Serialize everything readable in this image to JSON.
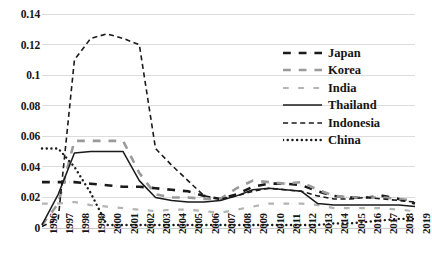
{
  "chart_data": {
    "type": "line",
    "title": "",
    "xlabel": "",
    "ylabel": "",
    "ylim": [
      0,
      0.14
    ],
    "ytick_step": 0.02,
    "yticks": [
      "0",
      "0.02",
      "0.04",
      "0.06",
      "0.08",
      "0.1",
      "0.12",
      "0.14"
    ],
    "ytick_values": [
      0,
      0.02,
      0.04,
      0.06,
      0.08,
      0.1,
      0.12,
      0.14
    ],
    "grid": "horizontal",
    "legend_position": "upper-right",
    "categories": [
      "1996",
      "1997",
      "1998",
      "1999",
      "2000",
      "2001",
      "2002",
      "2003",
      "2004",
      "2005",
      "2006",
      "2007",
      "2008",
      "2009",
      "2010",
      "2011",
      "2012",
      "2013",
      "2014",
      "2015",
      "2016",
      "2017",
      "2018",
      "2019"
    ],
    "series": [
      {
        "name": "Japan",
        "style": "dash-dot",
        "color": "#1a1a1a",
        "width": 2.6,
        "values": [
          0.03,
          0.03,
          0.03,
          0.029,
          0.028,
          0.027,
          0.027,
          0.026,
          0.025,
          0.024,
          0.021,
          0.019,
          0.022,
          0.027,
          0.029,
          0.029,
          0.028,
          0.024,
          0.021,
          0.02,
          0.02,
          0.021,
          0.019,
          0.016
        ]
      },
      {
        "name": "Korea",
        "style": "dash-dot",
        "color": "#9a9a9a",
        "width": 2.6,
        "values": [
          0.002,
          0.016,
          0.057,
          0.057,
          0.057,
          0.057,
          0.036,
          0.022,
          0.02,
          0.02,
          0.019,
          0.019,
          0.026,
          0.031,
          0.03,
          0.029,
          0.03,
          0.025,
          0.021,
          0.02,
          0.02,
          0.02,
          0.019,
          0.018
        ]
      },
      {
        "name": "India",
        "style": "dash-dot-dot",
        "color": "#b4b4b4",
        "width": 2.2,
        "values": [
          0.016,
          0.016,
          0.017,
          0.015,
          0.014,
          0.013,
          0.012,
          0.011,
          0.012,
          0.012,
          0.011,
          0.01,
          0.012,
          0.014,
          0.016,
          0.016,
          0.016,
          0.015,
          0.013,
          0.013,
          0.013,
          0.013,
          0.012,
          0.011
        ]
      },
      {
        "name": "Thailand",
        "style": "solid",
        "color": "#1a1a1a",
        "width": 1.5,
        "values": [
          0.002,
          0.022,
          0.049,
          0.05,
          0.05,
          0.05,
          0.031,
          0.02,
          0.018,
          0.017,
          0.017,
          0.018,
          0.021,
          0.025,
          0.026,
          0.025,
          0.024,
          0.016,
          0.015,
          0.015,
          0.015,
          0.015,
          0.015,
          0.014
        ]
      },
      {
        "name": "Indonesia",
        "style": "dashed",
        "color": "#1a1a1a",
        "width": 1.6,
        "values": [
          0.001,
          0.006,
          0.11,
          0.124,
          0.127,
          0.124,
          0.12,
          0.052,
          0.041,
          0.031,
          0.021,
          0.019,
          0.021,
          0.024,
          0.026,
          0.025,
          0.024,
          0.021,
          0.019,
          0.019,
          0.02,
          0.019,
          0.018,
          0.017
        ]
      },
      {
        "name": "China",
        "style": "dotted",
        "color": "#1a1a1a",
        "width": 2.4,
        "values": [
          0.052,
          0.052,
          0.04,
          0.023,
          0.002,
          0.002,
          0.002,
          0.002,
          0.002,
          0.002,
          0.002,
          0.002,
          0.002,
          0.002,
          0.002,
          0.002,
          0.002,
          0.002,
          0.003,
          0.003,
          0.004,
          0.005,
          0.006,
          0.006
        ]
      }
    ]
  },
  "legend": {
    "items": [
      {
        "label": "Japan"
      },
      {
        "label": "Korea"
      },
      {
        "label": "India"
      },
      {
        "label": "Thailand"
      },
      {
        "label": "Indonesia"
      },
      {
        "label": "China"
      }
    ]
  }
}
